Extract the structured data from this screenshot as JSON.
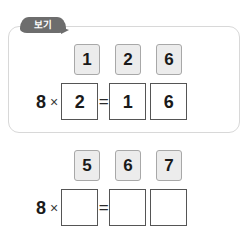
{
  "panel": {
    "tag_label": "보기"
  },
  "example": {
    "choices": [
      "1",
      "2",
      "6"
    ],
    "equation": {
      "multiplicand": "8",
      "times_symbol": "×",
      "equals_symbol": "=",
      "multiplier_box": "2",
      "product_boxes": [
        "1",
        "6"
      ]
    }
  },
  "exercise": {
    "choices": [
      "5",
      "6",
      "7"
    ],
    "equation": {
      "multiplicand": "8",
      "times_symbol": "×",
      "equals_symbol": "=",
      "multiplier_box": "",
      "product_boxes": [
        "",
        ""
      ]
    }
  },
  "colors": {
    "tile_fill": "#ececec",
    "tile_border": "#a8a8a8",
    "panel_border": "#d8d8d8",
    "tag_background": "#6d6d6d",
    "box_border": "#555555",
    "text": "#1a1a1a"
  }
}
